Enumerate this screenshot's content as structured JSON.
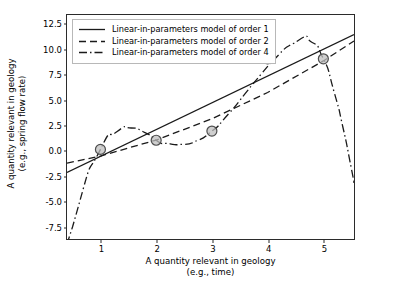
{
  "chart_data": {
    "type": "line",
    "title": "",
    "xlabel": "A quantity relevant in geology (e.g., time)",
    "xlabel_line1": "A quantity relevant in geology",
    "xlabel_line2": "(e.g., time)",
    "ylabel": "A quantity relevant in geology (e.g., spring flow rate)",
    "ylabel_line1": "A quantity relevant in geology",
    "ylabel_line2": "(e.g., spring flow rate)",
    "xlim": [
      0.4,
      5.55
    ],
    "ylim": [
      -8.7,
      13.3
    ],
    "xticks": [
      1,
      2,
      3,
      4,
      5
    ],
    "xticklabels": [
      "1",
      "2",
      "3",
      "4",
      "5"
    ],
    "yticks": [
      -7.5,
      -5.0,
      -2.5,
      0.0,
      2.5,
      5.0,
      7.5,
      10.0,
      12.5
    ],
    "yticklabels": [
      "-7.5",
      "-5.0",
      "-2.5",
      "0.0",
      "2.5",
      "5.0",
      "7.5",
      "10.0",
      "12.5"
    ],
    "grid": false,
    "legend_position": "upper left",
    "scatter": {
      "name": "Observed data",
      "x": [
        1,
        2,
        3,
        4,
        5
      ],
      "y": [
        0.1,
        1.0,
        1.9,
        9.0,
        9.0
      ],
      "marker": "circle",
      "facecolor": "#bfbfbf",
      "edgecolor": "#4d4d4d"
    },
    "series": [
      {
        "name": "Linear-in-parameters model of order 1",
        "linestyle": "solid",
        "color": "#1a1a1a",
        "x": [
          0.4,
          5.55
        ],
        "y": [
          -2.17,
          11.37
        ]
      },
      {
        "name": "Linear-in-parameters model of order 2",
        "linestyle": "dashed",
        "color": "#1a1a1a",
        "x": [
          0.4,
          1.0,
          2.0,
          3.0,
          4.0,
          5.0,
          5.55
        ],
        "y": [
          -1.25,
          -0.55,
          1.02,
          3.1,
          5.69,
          8.79,
          10.75
        ]
      },
      {
        "name": "Linear-in-parameters model of order 4",
        "linestyle": "dashdot",
        "color": "#1a1a1a",
        "x": [
          0.4,
          0.5,
          0.7,
          1.0,
          1.3,
          1.55,
          1.8,
          2.0,
          2.25,
          2.5,
          2.75,
          3.0,
          3.3,
          3.6,
          3.9,
          4.2,
          4.55,
          4.8,
          5.0,
          5.2,
          5.35,
          5.5,
          5.55
        ],
        "y": [
          -9.2,
          -7.5,
          -3.6,
          0.1,
          1.85,
          2.2,
          1.75,
          1.0,
          0.65,
          0.6,
          1.0,
          1.9,
          3.6,
          5.6,
          7.6,
          9.4,
          10.8,
          10.6,
          9.0,
          5.6,
          2.3,
          -1.7,
          -3.2
        ]
      }
    ]
  },
  "legend": {
    "items": [
      {
        "label": "Linear-in-parameters model of order 1",
        "style": "solid"
      },
      {
        "label": "Linear-in-parameters model of order 2",
        "style": "dashed"
      },
      {
        "label": "Linear-in-parameters model of order 4",
        "style": "dashdot"
      }
    ]
  }
}
